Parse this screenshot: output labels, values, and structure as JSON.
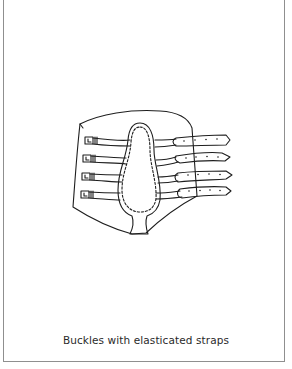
{
  "figure": {
    "caption": "Buckles with elasticated straps",
    "strap_count": 4,
    "colors": {
      "line": "#1e1e1e",
      "background": "#ffffff",
      "frame": "#8f8f8f"
    }
  }
}
